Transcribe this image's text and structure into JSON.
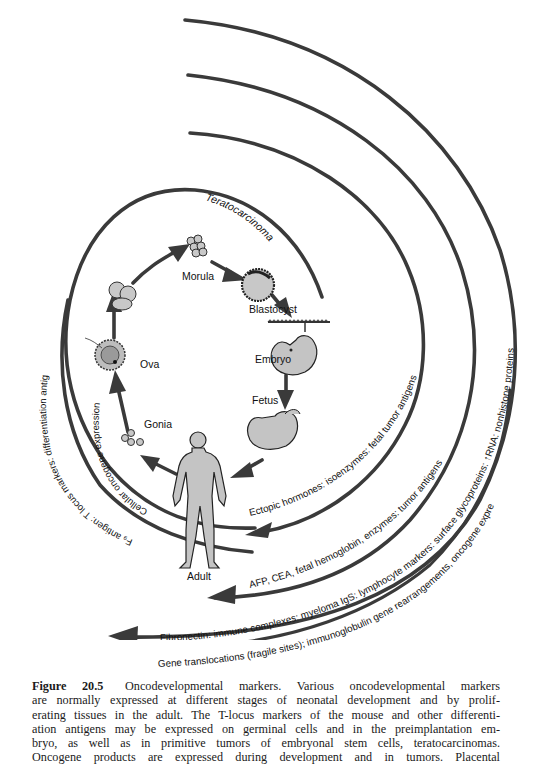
{
  "figure": {
    "stages": {
      "morula": "Morula",
      "blastocyst": "Blastocyst",
      "embryo": "Embryo",
      "fetus": "Fetus",
      "adult": "Adult",
      "gonia": "Gonia",
      "ova": "Ova"
    },
    "arc_labels": {
      "teratocarcinoma": "Teratocarcinoma",
      "cellular_oncogene": "Cellular oncogene expression",
      "f9_antigen": "F₉ antigen: T locus markers: differentiation antigens",
      "ectopic_hormones": "Ectopic hormones: isoenzymes: fetal tumor antigens",
      "afp_cea": "AFP, CEA, fetal hemoglobin, enzymes: tumor antigens",
      "fibronectin": "Fibronectin: immune complexes: myeloma IgS: lymphocyte markers: surface glycoproteins: ↑RNA: nonhistone proteins",
      "gene_translocations": "Gene translocations (fragile sites); immunoglobulin gene rearrangements, oncogene expression"
    }
  },
  "caption": {
    "figure_number": "Figure 20.5",
    "lines": [
      "Oncodevelopmental markers. Various oncodevelopmental markers",
      "are normally expressed at different stages of neonatal development and by prolif-",
      "erating tissues in the adult. The T-locus markers of the mouse and other differenti-",
      "ation antigens may be expressed on germinal cells and in the preimplantation em-",
      "bryo, as well as in primitive tumors of embryonal stem cells, teratocarcinomas.",
      "Oncogene products are expressed during development and in tumors. Placental"
    ]
  }
}
